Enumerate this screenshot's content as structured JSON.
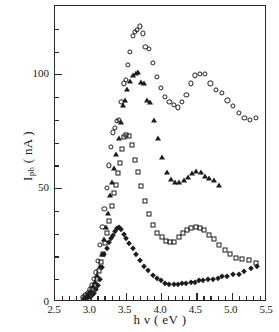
{
  "figure": {
    "background": "#ffffff",
    "marker_color": "#1d1d1d",
    "axis_color": "#2b2b2b"
  },
  "chart_data": {
    "type": "scatter",
    "title": "",
    "xlabel": "h ν ( eV )",
    "ylabel": "I_ph ( nA )",
    "ylabel_main": "I",
    "ylabel_sub": "ph",
    "ylabel_unit": "( nA )",
    "xlim": [
      2.5,
      5.5
    ],
    "ylim": [
      0,
      130
    ],
    "xticks": [
      2.5,
      3.0,
      3.5,
      4.0,
      4.5,
      5.0,
      5.5
    ],
    "xticklabels": [
      "2.5",
      "3.0",
      "3.5",
      "4.0",
      "4.5",
      "5.0",
      "5.5"
    ],
    "xminor_step": 0.1,
    "yticks": [
      0,
      50,
      100
    ],
    "yticklabels": [
      "0",
      "50",
      "100"
    ],
    "yminor_step": 10,
    "grid": false,
    "legend": "none",
    "series": [
      {
        "name": "series-circles",
        "marker": "circle-open",
        "points": [
          [
            2.9,
            2.0
          ],
          [
            2.93,
            3.0
          ],
          [
            2.96,
            4.0
          ],
          [
            2.99,
            5.5
          ],
          [
            3.02,
            7.5
          ],
          [
            3.05,
            10.0
          ],
          [
            3.08,
            13.0
          ],
          [
            3.11,
            18.0
          ],
          [
            3.14,
            25.0
          ],
          [
            3.17,
            33.0
          ],
          [
            3.2,
            41.0
          ],
          [
            3.23,
            50.0
          ],
          [
            3.26,
            60.0
          ],
          [
            3.29,
            68.0
          ],
          [
            3.32,
            74.5
          ],
          [
            3.35,
            76.5
          ],
          [
            3.38,
            79.5
          ],
          [
            3.41,
            80.0
          ],
          [
            3.44,
            88.0
          ],
          [
            3.47,
            96.0
          ],
          [
            3.5,
            97.5
          ],
          [
            3.53,
            104.0
          ],
          [
            3.56,
            110.0
          ],
          [
            3.6,
            117.0
          ],
          [
            3.63,
            118.5
          ],
          [
            3.66,
            119.5
          ],
          [
            3.7,
            121.0
          ],
          [
            3.74,
            118.0
          ],
          [
            3.78,
            112.0
          ],
          [
            3.83,
            111.0
          ],
          [
            3.88,
            105.0
          ],
          [
            3.94,
            99.0
          ],
          [
            4.0,
            94.0
          ],
          [
            4.06,
            90.0
          ],
          [
            4.12,
            88.0
          ],
          [
            4.18,
            86.5
          ],
          [
            4.24,
            85.5
          ],
          [
            4.3,
            88.0
          ],
          [
            4.36,
            91.0
          ],
          [
            4.42,
            96.0
          ],
          [
            4.48,
            99.5
          ],
          [
            4.55,
            100.0
          ],
          [
            4.62,
            100.0
          ],
          [
            4.7,
            96.0
          ],
          [
            4.78,
            93.0
          ],
          [
            4.86,
            92.0
          ],
          [
            4.94,
            88.5
          ],
          [
            5.02,
            86.0
          ],
          [
            5.1,
            83.0
          ],
          [
            5.18,
            81.0
          ],
          [
            5.26,
            80.0
          ],
          [
            5.34,
            81.0
          ]
        ]
      },
      {
        "name": "series-triangles",
        "marker": "triangle-filled",
        "points": [
          [
            2.92,
            1.5
          ],
          [
            2.95,
            2.5
          ],
          [
            2.98,
            3.5
          ],
          [
            3.01,
            5.0
          ],
          [
            3.04,
            7.0
          ],
          [
            3.07,
            9.0
          ],
          [
            3.1,
            12.0
          ],
          [
            3.13,
            16.0
          ],
          [
            3.16,
            21.0
          ],
          [
            3.19,
            27.5
          ],
          [
            3.22,
            33.0
          ],
          [
            3.25,
            39.0
          ],
          [
            3.28,
            47.0
          ],
          [
            3.31,
            52.5
          ],
          [
            3.34,
            59.0
          ],
          [
            3.37,
            65.0
          ],
          [
            3.4,
            72.0
          ],
          [
            3.43,
            79.0
          ],
          [
            3.46,
            86.5
          ],
          [
            3.49,
            88.5
          ],
          [
            3.52,
            93.5
          ],
          [
            3.56,
            97.0
          ],
          [
            3.6,
            99.5
          ],
          [
            3.64,
            100.5
          ],
          [
            3.68,
            101.0
          ],
          [
            3.72,
            96.5
          ],
          [
            3.76,
            96.0
          ],
          [
            3.8,
            88.5
          ],
          [
            3.85,
            88.0
          ],
          [
            3.9,
            80.0
          ],
          [
            3.96,
            72.0
          ],
          [
            4.02,
            63.5
          ],
          [
            4.08,
            57.0
          ],
          [
            4.14,
            54.0
          ],
          [
            4.2,
            52.5
          ],
          [
            4.26,
            52.5
          ],
          [
            4.32,
            53.5
          ],
          [
            4.38,
            55.0
          ],
          [
            4.44,
            56.5
          ],
          [
            4.5,
            57.5
          ],
          [
            4.56,
            57.0
          ],
          [
            4.62,
            55.5
          ],
          [
            4.68,
            54.5
          ],
          [
            4.75,
            53.5
          ],
          [
            4.82,
            51.5
          ]
        ]
      },
      {
        "name": "series-squares",
        "marker": "square-open",
        "points": [
          [
            2.91,
            1.5
          ],
          [
            2.94,
            2.0
          ],
          [
            2.97,
            3.0
          ],
          [
            3.0,
            4.0
          ],
          [
            3.03,
            5.5
          ],
          [
            3.06,
            7.5
          ],
          [
            3.09,
            10.0
          ],
          [
            3.12,
            13.5
          ],
          [
            3.15,
            17.5
          ],
          [
            3.18,
            21.0
          ],
          [
            3.21,
            26.0
          ],
          [
            3.24,
            30.5
          ],
          [
            3.27,
            35.5
          ],
          [
            3.3,
            42.0
          ],
          [
            3.33,
            48.0
          ],
          [
            3.36,
            51.5
          ],
          [
            3.39,
            56.5
          ],
          [
            3.42,
            61.0
          ],
          [
            3.45,
            67.0
          ],
          [
            3.48,
            72.5
          ],
          [
            3.51,
            73.5
          ],
          [
            3.55,
            73.0
          ],
          [
            3.59,
            69.0
          ],
          [
            3.63,
            62.5
          ],
          [
            3.67,
            57.0
          ],
          [
            3.72,
            51.0
          ],
          [
            3.77,
            44.5
          ],
          [
            3.83,
            38.5
          ],
          [
            3.89,
            34.0
          ],
          [
            3.95,
            30.5
          ],
          [
            4.01,
            28.5
          ],
          [
            4.07,
            27.0
          ],
          [
            4.13,
            26.5
          ],
          [
            4.19,
            26.5
          ],
          [
            4.25,
            28.5
          ],
          [
            4.31,
            30.5
          ],
          [
            4.37,
            31.5
          ],
          [
            4.43,
            32.5
          ],
          [
            4.49,
            33.0
          ],
          [
            4.55,
            32.5
          ],
          [
            4.61,
            31.5
          ],
          [
            4.68,
            29.5
          ],
          [
            4.75,
            27.5
          ],
          [
            4.82,
            25.0
          ],
          [
            4.9,
            23.0
          ],
          [
            4.98,
            21.0
          ],
          [
            5.06,
            19.5
          ],
          [
            5.14,
            19.0
          ],
          [
            5.24,
            18.5
          ],
          [
            5.34,
            17.0
          ]
        ]
      },
      {
        "name": "series-diamonds",
        "marker": "diamond-filled",
        "points": [
          [
            2.9,
            1.0
          ],
          [
            2.93,
            1.5
          ],
          [
            2.96,
            2.0
          ],
          [
            2.99,
            2.5
          ],
          [
            3.02,
            3.0
          ],
          [
            3.05,
            4.0
          ],
          [
            3.08,
            5.5
          ],
          [
            3.11,
            7.5
          ],
          [
            3.14,
            10.0
          ],
          [
            3.17,
            15.5
          ],
          [
            3.2,
            21.0
          ],
          [
            3.23,
            23.5
          ],
          [
            3.26,
            26.5
          ],
          [
            3.29,
            28.0
          ],
          [
            3.32,
            29.5
          ],
          [
            3.35,
            31.0
          ],
          [
            3.38,
            32.5
          ],
          [
            3.41,
            33.0
          ],
          [
            3.44,
            32.0
          ],
          [
            3.47,
            30.0
          ],
          [
            3.51,
            28.0
          ],
          [
            3.55,
            26.0
          ],
          [
            3.6,
            23.5
          ],
          [
            3.65,
            21.0
          ],
          [
            3.7,
            18.5
          ],
          [
            3.76,
            16.0
          ],
          [
            3.82,
            14.0
          ],
          [
            3.88,
            12.0
          ],
          [
            3.94,
            10.5
          ],
          [
            4.0,
            9.5
          ],
          [
            4.06,
            8.5
          ],
          [
            4.12,
            8.0
          ],
          [
            4.18,
            8.0
          ],
          [
            4.24,
            8.0
          ],
          [
            4.3,
            8.5
          ],
          [
            4.36,
            8.5
          ],
          [
            4.42,
            9.0
          ],
          [
            4.48,
            9.0
          ],
          [
            4.54,
            9.5
          ],
          [
            4.6,
            9.5
          ],
          [
            4.66,
            10.0
          ],
          [
            4.73,
            10.0
          ],
          [
            4.8,
            10.5
          ],
          [
            4.87,
            11.5
          ],
          [
            4.94,
            11.5
          ],
          [
            5.02,
            12.5
          ],
          [
            5.1,
            12.5
          ],
          [
            5.18,
            13.5
          ],
          [
            5.27,
            15.0
          ],
          [
            5.36,
            16.0
          ]
        ]
      }
    ]
  }
}
